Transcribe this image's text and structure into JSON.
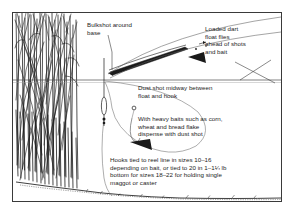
{
  "figure": {
    "type": "fishing-diagram",
    "title_visible": false,
    "border_color": "#3a3a3a",
    "background": "#ffffff",
    "ink_color": "#1d1d1d"
  },
  "callouts": {
    "bulkshot": "Bulkshot around\nbase",
    "loaded_dart": "Loaded dart\nfloat flies\nahead of shots\nand bait",
    "dust_shot": "Dust shot midway between\nfloat and hook",
    "heavy_baits": "With heavy baits such as corn,\nwheat and bread flake\ndispense with dust shot",
    "hooks": "Hooks tied to reel line in sizes 10–16\ndepending on bait, or tied to 20 in 1–1¼ lb\nbottom for sizes 18–22 for holding single\nmaggot or caster"
  },
  "scene": {
    "reeds_label": "reed-bed",
    "waterline_label": "water-surface-line",
    "lakebed_label": "lake-bed",
    "float_label": "dart-float-in-water",
    "flying_float_label": "dart-float-in-flight",
    "hook_label": "hook",
    "dust_shot_marker_label": "dust-shot",
    "bulkshot_marker_label": "bulkshot-at-float-base",
    "line_label": "fishing-line"
  }
}
